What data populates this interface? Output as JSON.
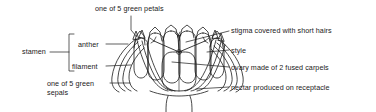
{
  "diagram": {
    "type": "botanical-cross-section",
    "background_color": "#ffffff",
    "ink_color": "#1a1a1a",
    "labels": {
      "petals": "one of 5 green petals",
      "stigma": "stigma covered with short hairs",
      "style": "style",
      "ovary": "ovary made of 2 fused carpels",
      "nectar": "nectar produced on receptacle",
      "stamen": "stamen",
      "anther": "anther",
      "filament": "filament",
      "sepals": "one of 5 green sepals"
    },
    "parts": [
      {
        "name": "petal",
        "count": 5,
        "note": "green petals forming the corolla"
      },
      {
        "name": "sepal",
        "count": 5,
        "note": "green sepals forming the calyx"
      },
      {
        "name": "stamen",
        "note": "composed of anther and filament"
      },
      {
        "name": "anther",
        "note": "pollen-bearing tip of the stamen"
      },
      {
        "name": "filament",
        "note": "stalk of the stamen"
      },
      {
        "name": "stigma",
        "note": "covered with short hairs"
      },
      {
        "name": "style",
        "note": "connects stigma to ovary"
      },
      {
        "name": "ovary",
        "carpels": 2,
        "note": "made of 2 fused carpels"
      },
      {
        "name": "receptacle",
        "note": "nectar produced on receptacle"
      }
    ]
  }
}
